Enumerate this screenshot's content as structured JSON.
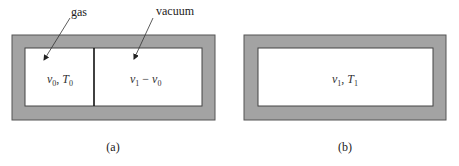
{
  "diagram": {
    "colors": {
      "wall_fill": "#a3a3a3",
      "wall_stroke": "#555555",
      "interior": "#ffffff",
      "divider": "#111111",
      "text": "#222222"
    },
    "panel_a": {
      "caption": "(a)",
      "annotations": {
        "gas": "gas",
        "vacuum": "vacuum"
      },
      "left_chamber": {
        "var1": "v",
        "sub1": "0",
        "sep": ", ",
        "var2": "T",
        "sub2": "0"
      },
      "right_chamber": {
        "var1": "v",
        "sub1": "1",
        "op": " − ",
        "var2": "v",
        "sub2": "0"
      }
    },
    "panel_b": {
      "caption": "(b)",
      "chamber": {
        "var1": "v",
        "sub1": "1",
        "sep": ", ",
        "var2": "T",
        "sub2": "1"
      }
    }
  }
}
